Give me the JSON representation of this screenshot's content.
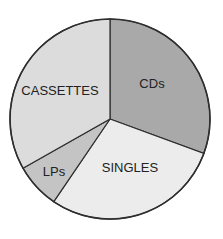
{
  "chart_data": {
    "type": "pie",
    "title": "",
    "start_angle_deg": 0,
    "direction": "clockwise",
    "categories": [
      "CDs",
      "SINGLES",
      "LPs",
      "CASSETTES"
    ],
    "values": [
      30.6,
      28.9,
      7.3,
      33.2
    ],
    "unit": "percent (estimated from wedge angles)",
    "colors": [
      "#a9a9a9",
      "#ececec",
      "#c4c4c4",
      "#dcdcdc"
    ],
    "slices": [
      {
        "label": "CDs",
        "value": 30.6,
        "color": "#a9a9a9",
        "label_x": 152,
        "label_y": 85
      },
      {
        "label": "SINGLES",
        "value": 28.9,
        "color": "#ececec",
        "label_x": 130,
        "label_y": 169
      },
      {
        "label": "LPs",
        "value": 7.3,
        "color": "#c4c4c4",
        "label_x": 54,
        "label_y": 173
      },
      {
        "label": "CASSETTES",
        "value": 33.2,
        "color": "#dcdcdc",
        "label_x": 60,
        "label_y": 92
      }
    ],
    "legend": "none (labels drawn inside slices)",
    "outline_color": "#2e2e2e"
  },
  "geometry": {
    "cx": 110,
    "cy": 119,
    "r": 100
  }
}
